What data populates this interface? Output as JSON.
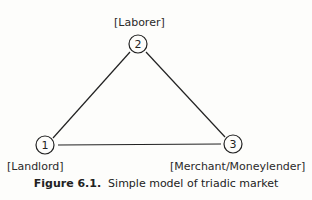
{
  "figure": {
    "nodes": [
      {
        "id": "1",
        "label": "[Landlord]"
      },
      {
        "id": "2",
        "label": "[Laborer]"
      },
      {
        "id": "3",
        "label": "[Merchant/Moneylender]"
      }
    ],
    "edges": [
      [
        "1",
        "2"
      ],
      [
        "2",
        "3"
      ],
      [
        "1",
        "3"
      ]
    ],
    "caption_number": "Figure 6.1.",
    "caption_text": "Simple model of triadic market"
  }
}
